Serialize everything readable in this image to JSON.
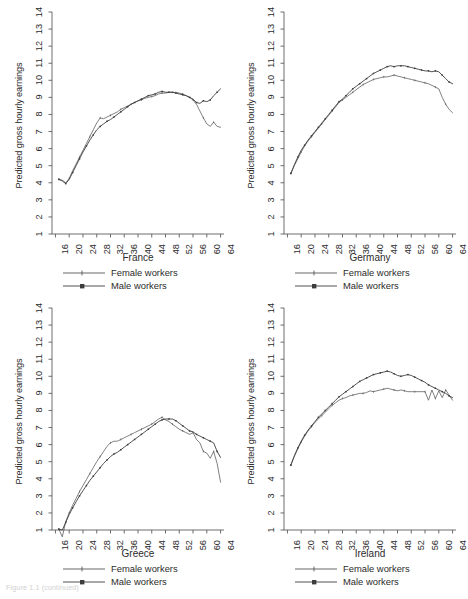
{
  "figure": {
    "caption": "Figure 1.1 (continued)",
    "ylabel": "Predicted gross hourly earnings",
    "legend": [
      {
        "key": "female-line",
        "label": "Female workers"
      },
      {
        "key": "male-line",
        "label": "Male workers"
      }
    ]
  },
  "chart_data": [
    {
      "type": "line",
      "title": "France",
      "xlabel": "",
      "ylabel": "Predicted gross hourly earnings",
      "xlim": [
        15,
        65
      ],
      "ylim": [
        1,
        14
      ],
      "xticks": [
        16,
        20,
        24,
        28,
        32,
        36,
        40,
        44,
        48,
        52,
        56,
        60,
        64
      ],
      "yticks": [
        1,
        2,
        3,
        4,
        5,
        6,
        7,
        8,
        9,
        10,
        11,
        12,
        13,
        14
      ],
      "grid": false,
      "legend_position": "below",
      "x": [
        17,
        18,
        19,
        20,
        21,
        22,
        23,
        24,
        25,
        26,
        27,
        28,
        29,
        30,
        31,
        32,
        33,
        34,
        35,
        36,
        37,
        38,
        39,
        40,
        41,
        42,
        43,
        44,
        45,
        46,
        47,
        48,
        49,
        50,
        51,
        52,
        53,
        54,
        55,
        56,
        57,
        58,
        59,
        60,
        61,
        62,
        63,
        64
      ],
      "series": [
        {
          "name": "Female workers",
          "values": [
            4.2,
            4.15,
            4.0,
            4.25,
            4.7,
            5.1,
            5.5,
            5.9,
            6.3,
            6.7,
            7.1,
            7.5,
            7.8,
            7.75,
            7.85,
            7.95,
            8.05,
            8.15,
            8.3,
            8.4,
            8.5,
            8.6,
            8.7,
            8.8,
            8.85,
            8.95,
            9.0,
            9.05,
            9.1,
            9.2,
            9.25,
            9.25,
            9.3,
            9.3,
            9.3,
            9.25,
            9.2,
            9.1,
            9.0,
            8.85,
            8.6,
            8.2,
            7.8,
            7.45,
            7.3,
            7.55,
            7.3,
            7.25
          ]
        },
        {
          "name": "Male workers",
          "values": [
            4.2,
            4.1,
            3.95,
            4.2,
            4.6,
            5.0,
            5.4,
            5.8,
            6.15,
            6.5,
            6.8,
            7.1,
            7.3,
            7.45,
            7.6,
            7.7,
            7.85,
            8.0,
            8.15,
            8.3,
            8.45,
            8.6,
            8.7,
            8.8,
            8.9,
            9.0,
            9.1,
            9.15,
            9.2,
            9.3,
            9.35,
            9.3,
            9.3,
            9.3,
            9.25,
            9.2,
            9.15,
            9.1,
            9.0,
            8.9,
            8.7,
            8.65,
            8.8,
            8.75,
            8.85,
            9.1,
            9.3,
            9.5
          ]
        }
      ]
    },
    {
      "type": "line",
      "title": "Germany",
      "xlabel": "",
      "ylabel": "Predicted gross hourly earnings",
      "xlim": [
        15,
        65
      ],
      "ylim": [
        1,
        14
      ],
      "xticks": [
        16,
        20,
        24,
        28,
        32,
        36,
        40,
        44,
        48,
        52,
        56,
        60,
        64
      ],
      "yticks": [
        1,
        2,
        3,
        4,
        5,
        6,
        7,
        8,
        9,
        10,
        11,
        12,
        13,
        14
      ],
      "grid": false,
      "legend_position": "below",
      "x": [
        17,
        18,
        19,
        20,
        21,
        22,
        23,
        24,
        25,
        26,
        27,
        28,
        29,
        30,
        31,
        32,
        33,
        34,
        35,
        36,
        37,
        38,
        39,
        40,
        41,
        42,
        43,
        44,
        45,
        46,
        47,
        48,
        49,
        50,
        51,
        52,
        53,
        54,
        55,
        56,
        57,
        58,
        59,
        60,
        61,
        62,
        63,
        64
      ],
      "series": [
        {
          "name": "Female workers",
          "values": [
            4.55,
            5.0,
            5.4,
            5.8,
            6.15,
            6.45,
            6.7,
            6.95,
            7.2,
            7.45,
            7.7,
            7.95,
            8.2,
            8.45,
            8.7,
            8.85,
            9.0,
            9.15,
            9.3,
            9.45,
            9.6,
            9.75,
            9.85,
            9.95,
            10.05,
            10.1,
            10.15,
            10.2,
            10.2,
            10.25,
            10.3,
            10.25,
            10.2,
            10.15,
            10.1,
            10.05,
            10.0,
            9.95,
            9.9,
            9.85,
            9.8,
            9.7,
            9.6,
            9.5,
            9.0,
            8.6,
            8.3,
            8.1
          ]
        },
        {
          "name": "Male workers",
          "values": [
            4.55,
            5.05,
            5.5,
            5.9,
            6.2,
            6.5,
            6.75,
            7.0,
            7.25,
            7.5,
            7.75,
            8.0,
            8.25,
            8.5,
            8.75,
            8.9,
            9.1,
            9.3,
            9.5,
            9.65,
            9.8,
            9.95,
            10.1,
            10.25,
            10.4,
            10.5,
            10.6,
            10.7,
            10.8,
            10.85,
            10.8,
            10.85,
            10.85,
            10.85,
            10.8,
            10.75,
            10.7,
            10.65,
            10.6,
            10.55,
            10.55,
            10.5,
            10.55,
            10.5,
            10.3,
            10.1,
            9.9,
            9.8
          ]
        }
      ]
    },
    {
      "type": "line",
      "title": "Greece",
      "xlabel": "",
      "ylabel": "Predicted gross hourly earnings",
      "xlim": [
        15,
        65
      ],
      "ylim": [
        1,
        14
      ],
      "xticks": [
        16,
        20,
        24,
        28,
        32,
        36,
        40,
        44,
        48,
        52,
        56,
        60,
        64
      ],
      "yticks": [
        1,
        2,
        3,
        4,
        5,
        6,
        7,
        8,
        9,
        10,
        11,
        12,
        13,
        14
      ],
      "grid": false,
      "legend_position": "below",
      "x": [
        17,
        18,
        19,
        20,
        21,
        22,
        23,
        24,
        25,
        26,
        27,
        28,
        29,
        30,
        31,
        32,
        33,
        34,
        35,
        36,
        37,
        38,
        39,
        40,
        41,
        42,
        43,
        44,
        45,
        46,
        47,
        48,
        49,
        50,
        51,
        52,
        53,
        54,
        55,
        56,
        57,
        58,
        59,
        60,
        61,
        62,
        63,
        64
      ],
      "series": [
        {
          "name": "Female workers",
          "values": [
            1.05,
            0.6,
            1.5,
            2.0,
            2.45,
            2.85,
            3.25,
            3.6,
            3.95,
            4.3,
            4.65,
            5.0,
            5.3,
            5.6,
            5.9,
            6.1,
            6.2,
            6.2,
            6.3,
            6.4,
            6.5,
            6.6,
            6.7,
            6.8,
            6.9,
            7.0,
            7.1,
            7.2,
            7.35,
            7.5,
            7.6,
            7.45,
            7.35,
            7.2,
            7.05,
            6.9,
            6.8,
            6.7,
            6.6,
            6.7,
            6.3,
            6.1,
            5.6,
            5.5,
            5.2,
            5.6,
            4.9,
            3.8
          ]
        },
        {
          "name": "Male workers",
          "values": [
            1.05,
            1.0,
            1.45,
            1.9,
            2.3,
            2.65,
            3.0,
            3.3,
            3.6,
            3.9,
            4.15,
            4.4,
            4.65,
            4.9,
            5.1,
            5.3,
            5.45,
            5.55,
            5.7,
            5.85,
            6.0,
            6.15,
            6.3,
            6.45,
            6.6,
            6.75,
            6.9,
            7.05,
            7.2,
            7.35,
            7.45,
            7.5,
            7.5,
            7.5,
            7.4,
            7.25,
            7.1,
            6.95,
            6.8,
            6.75,
            6.6,
            6.5,
            6.4,
            6.3,
            6.2,
            6.1,
            5.6,
            5.25
          ]
        }
      ]
    },
    {
      "type": "line",
      "title": "Ireland",
      "xlabel": "",
      "ylabel": "Predicted gross hourly earnings",
      "xlim": [
        15,
        65
      ],
      "ylim": [
        1,
        14
      ],
      "xticks": [
        16,
        20,
        24,
        28,
        32,
        36,
        40,
        44,
        48,
        52,
        56,
        60,
        64
      ],
      "yticks": [
        1,
        2,
        3,
        4,
        5,
        6,
        7,
        8,
        9,
        10,
        11,
        12,
        13,
        14
      ],
      "grid": false,
      "legend_position": "below",
      "x": [
        17,
        18,
        19,
        20,
        21,
        22,
        23,
        24,
        25,
        26,
        27,
        28,
        29,
        30,
        31,
        32,
        33,
        34,
        35,
        36,
        37,
        38,
        39,
        40,
        41,
        42,
        43,
        44,
        45,
        46,
        47,
        48,
        49,
        50,
        51,
        52,
        53,
        54,
        55,
        56,
        57,
        58,
        59,
        60,
        61,
        62,
        63,
        64
      ],
      "series": [
        {
          "name": "Female workers",
          "values": [
            4.8,
            5.3,
            5.75,
            6.15,
            6.5,
            6.8,
            7.05,
            7.3,
            7.5,
            7.7,
            7.9,
            8.1,
            8.3,
            8.45,
            8.6,
            8.7,
            8.75,
            8.85,
            8.9,
            8.95,
            9.0,
            9.0,
            9.05,
            9.15,
            9.1,
            9.15,
            9.2,
            9.25,
            9.3,
            9.25,
            9.2,
            9.15,
            9.2,
            9.15,
            9.1,
            9.1,
            9.1,
            9.1,
            9.1,
            9.1,
            8.6,
            9.2,
            8.7,
            9.15,
            8.75,
            9.2,
            8.9,
            8.6
          ]
        },
        {
          "name": "Male workers",
          "values": [
            4.8,
            5.35,
            5.8,
            6.2,
            6.55,
            6.85,
            7.1,
            7.35,
            7.6,
            7.8,
            8.0,
            8.2,
            8.4,
            8.6,
            8.8,
            8.95,
            9.1,
            9.25,
            9.4,
            9.55,
            9.7,
            9.8,
            9.9,
            10.0,
            10.1,
            10.15,
            10.2,
            10.25,
            10.3,
            10.25,
            10.15,
            10.05,
            10.0,
            10.05,
            10.1,
            10.05,
            9.95,
            9.85,
            9.75,
            9.65,
            9.5,
            9.4,
            9.3,
            9.2,
            9.1,
            9.0,
            8.85,
            8.75
          ]
        }
      ]
    }
  ]
}
